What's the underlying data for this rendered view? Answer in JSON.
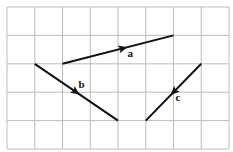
{
  "grid": {
    "cols": 8,
    "rows": 5,
    "origin_x": 7,
    "origin_y": 7,
    "cell_w": 27.75,
    "cell_h": 28.4,
    "line_color": "#bdbdbd"
  },
  "vectors": [
    {
      "name": "a",
      "label": "a",
      "from": [
        2,
        2
      ],
      "to": [
        6,
        1
      ],
      "arrow_t": 0.55,
      "label_offset": [
        4,
        9
      ]
    },
    {
      "name": "b",
      "label": "b",
      "from": [
        1,
        2
      ],
      "to": [
        4,
        4
      ],
      "arrow_t": 0.5,
      "label_offset": [
        2,
        -4
      ]
    },
    {
      "name": "c",
      "label": "c",
      "from": [
        7,
        2
      ],
      "to": [
        5,
        4
      ],
      "arrow_t": 0.5,
      "label_offset": [
        2,
        9
      ]
    }
  ],
  "colors": {
    "vector": "#111111",
    "background": "#ffffff"
  }
}
